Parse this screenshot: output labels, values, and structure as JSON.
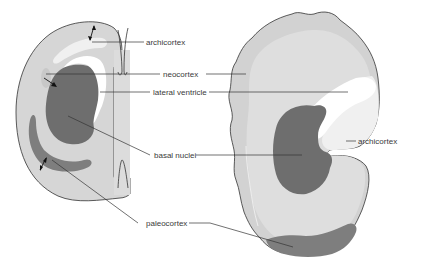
{
  "diagram": {
    "colors": {
      "outer_cortex": "#d4d4d4",
      "inner_matter": "#dedede",
      "basal_nuclei": "#6e6e6e",
      "paleocortex": "#7e7e7e",
      "archicortex": "#f0f0f0",
      "ventricle": "#ffffff",
      "outline": "#333333",
      "leader": "#333333"
    },
    "labels": {
      "archicortex_left": "archicortex",
      "neocortex": "neocortex",
      "lateral_ventricle": "lateral ventricle",
      "basal_nuclei": "basal nuclei",
      "paleocortex": "paleocortex",
      "archicortex_right": "archicortex"
    }
  }
}
